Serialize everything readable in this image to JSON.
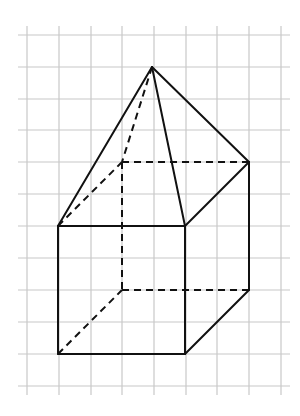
{
  "figure": {
    "colors": {
      "background": "#ffffff",
      "grid": "#c8c8c8",
      "edge": "#111111"
    },
    "grid": {
      "x_lines": [
        27,
        59,
        91,
        122,
        154,
        186,
        217,
        249,
        281
      ],
      "y_lines": [
        35,
        67,
        99,
        130,
        162,
        194,
        226,
        258,
        290,
        322,
        354,
        386
      ],
      "x_extent": [
        18,
        290
      ],
      "y_extent": [
        26,
        395
      ]
    },
    "vertices": {
      "apex": [
        152,
        67
      ],
      "front_top_left": [
        58,
        226
      ],
      "front_top_right": [
        185,
        226
      ],
      "front_bottom_left": [
        58,
        354
      ],
      "front_bottom_right": [
        185,
        354
      ],
      "back_top_left": [
        122,
        162
      ],
      "back_top_right": [
        249,
        162
      ],
      "back_bottom_left": [
        122,
        290
      ],
      "back_bottom_right": [
        249,
        290
      ]
    },
    "edges_solid": [
      [
        "apex",
        "front_top_left"
      ],
      [
        "apex",
        "front_top_right"
      ],
      [
        "apex",
        "back_top_right"
      ],
      [
        "front_top_left",
        "front_top_right"
      ],
      [
        "front_top_right",
        "front_bottom_right"
      ],
      [
        "front_bottom_right",
        "front_bottom_left"
      ],
      [
        "front_bottom_left",
        "front_top_left"
      ],
      [
        "front_top_right",
        "back_top_right"
      ],
      [
        "back_top_right",
        "back_bottom_right"
      ],
      [
        "front_bottom_right",
        "back_bottom_right"
      ]
    ],
    "edges_dashed": [
      [
        "apex",
        "back_top_left"
      ],
      [
        "front_top_left",
        "back_top_left"
      ],
      [
        "back_top_left",
        "back_top_right"
      ],
      [
        "back_top_left",
        "back_bottom_left"
      ],
      [
        "back_bottom_left",
        "back_bottom_right"
      ],
      [
        "front_bottom_left",
        "back_bottom_left"
      ]
    ]
  }
}
